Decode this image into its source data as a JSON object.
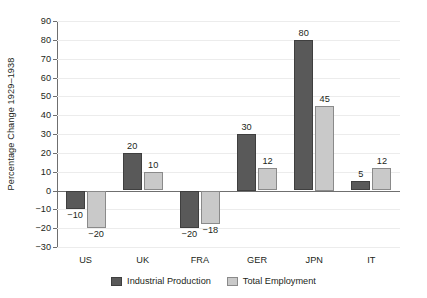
{
  "chart_data": {
    "type": "bar",
    "title": "",
    "subtitle": "",
    "xlabel": "",
    "ylabel": "Percentage Change 1929–1938",
    "categories": [
      "US",
      "UK",
      "FRA",
      "GER",
      "JPN",
      "IT"
    ],
    "series": [
      {
        "name": "Industrial Production",
        "color": "#595959",
        "values": [
          -10,
          20,
          -20,
          30,
          80,
          5
        ],
        "labels": [
          "−10",
          "20",
          "−20",
          "30",
          "80",
          "5"
        ]
      },
      {
        "name": "Total Employment",
        "color": "#c9c9c9",
        "values": [
          -20,
          10,
          -18,
          12,
          45,
          12
        ],
        "labels": [
          "−20",
          "10",
          "−18",
          "12",
          "45",
          "12"
        ]
      }
    ],
    "ylim": [
      -30,
      90
    ],
    "yticks": [
      -30,
      -20,
      -10,
      0,
      10,
      20,
      30,
      40,
      50,
      60,
      70,
      80,
      90
    ],
    "ytick_labels": [
      "−30",
      "−20",
      "−10",
      "0",
      "10",
      "20",
      "30",
      "40",
      "50",
      "60",
      "70",
      "80",
      "90"
    ],
    "grid": true,
    "grid_axis": "y",
    "legend_position": "bottom",
    "zero_line": true
  },
  "legend": {
    "items": [
      {
        "label": "Industrial Production",
        "swatch": "dark"
      },
      {
        "label": "Total Employment",
        "swatch": "light"
      }
    ]
  }
}
